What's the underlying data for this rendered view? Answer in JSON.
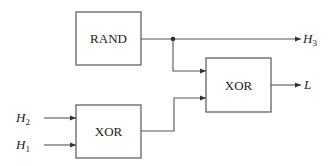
{
  "diagram": {
    "type": "block-diagram",
    "blocks": [
      {
        "id": "rand",
        "label": "RAND"
      },
      {
        "id": "xor1",
        "label": "XOR"
      },
      {
        "id": "xor2",
        "label": "XOR"
      }
    ],
    "inputs": [
      {
        "id": "h2",
        "name": "H",
        "sub": "2",
        "target": "xor1"
      },
      {
        "id": "h1",
        "name": "H",
        "sub": "1",
        "target": "xor1"
      }
    ],
    "outputs": [
      {
        "id": "h3",
        "name": "H",
        "sub": "3",
        "source": "rand"
      },
      {
        "id": "l",
        "name": "L",
        "sub": "",
        "source": "xor2"
      }
    ],
    "connections": [
      {
        "from": "rand",
        "to": "h3"
      },
      {
        "from": "rand",
        "to": "xor2",
        "via": "junction"
      },
      {
        "from": "xor1",
        "to": "xor2"
      },
      {
        "from": "xor2",
        "to": "l"
      }
    ],
    "colors": {
      "stroke": "#555555",
      "text": "#222222",
      "background": "#ffffff"
    }
  }
}
